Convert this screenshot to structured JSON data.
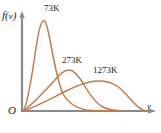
{
  "chart_data": {
    "type": "line",
    "title": "",
    "subtitle": "",
    "xlabel": "v",
    "ylabel": "f(v)",
    "origin_label": "O",
    "grid": false,
    "legend_position": "inline-annotations",
    "axis_color": "#8a8a8a",
    "curve_color": "#c07b4b",
    "text_color": "#1a1a1a",
    "background_color": "#ffffff",
    "xlim": [
      0,
      1
    ],
    "ylim": [
      0,
      1
    ],
    "note": "Maxwell-Boltzmann speed distribution curves at three temperatures; higher temperature gives a broader, flatter curve peaking at larger speed.",
    "series": [
      {
        "name": "73K",
        "label": "73K",
        "color": "#c07b4b",
        "peak_x": 0.16,
        "peak_y": 1.0,
        "x": [
          0.0,
          0.04,
          0.08,
          0.11,
          0.14,
          0.16,
          0.19,
          0.22,
          0.26,
          0.31,
          0.37,
          0.44,
          0.52,
          0.6,
          0.68,
          0.78,
          0.9,
          1.0
        ],
        "y": [
          0.0,
          0.33,
          0.72,
          0.92,
          0.99,
          1.0,
          0.95,
          0.83,
          0.64,
          0.44,
          0.28,
          0.17,
          0.1,
          0.06,
          0.03,
          0.015,
          0.005,
          0.0
        ]
      },
      {
        "name": "273K",
        "label": "273K",
        "color": "#c07b4b",
        "peak_x": 0.36,
        "peak_y": 0.46,
        "x": [
          0.0,
          0.05,
          0.1,
          0.16,
          0.22,
          0.28,
          0.33,
          0.36,
          0.4,
          0.45,
          0.51,
          0.58,
          0.66,
          0.75,
          0.84,
          0.92,
          1.0
        ],
        "y": [
          0.0,
          0.07,
          0.15,
          0.24,
          0.33,
          0.41,
          0.45,
          0.46,
          0.45,
          0.4,
          0.32,
          0.23,
          0.15,
          0.08,
          0.04,
          0.015,
          0.0
        ]
      },
      {
        "name": "1273K",
        "label": "1273K",
        "color": "#c07b4b",
        "peak_x": 0.63,
        "peak_y": 0.3,
        "x": [
          0.0,
          0.07,
          0.15,
          0.23,
          0.31,
          0.39,
          0.47,
          0.55,
          0.63,
          0.7,
          0.77,
          0.84,
          0.9,
          0.95,
          1.0
        ],
        "y": [
          0.0,
          0.03,
          0.07,
          0.11,
          0.16,
          0.21,
          0.25,
          0.28,
          0.3,
          0.29,
          0.26,
          0.2,
          0.13,
          0.06,
          0.0
        ]
      }
    ]
  },
  "axes": {
    "y_axis_label": "f(v)",
    "x_axis_label": "v",
    "origin": "O"
  },
  "annotations": {
    "curve_73k": "73K",
    "curve_273k": "273K",
    "curve_1273k": "1273K"
  }
}
